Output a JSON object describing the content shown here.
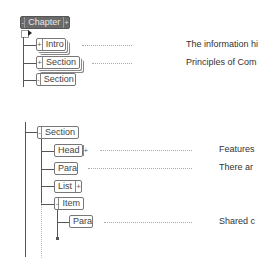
{
  "tree_top": {
    "root": {
      "label": "Chapter",
      "left_toggle": "-",
      "right_toggle": "+"
    },
    "children": [
      {
        "label": "Intro",
        "toggle": "+",
        "description": "The information hi"
      },
      {
        "label": "Section",
        "toggle": "+",
        "description": "Principles of Com"
      },
      {
        "label": "Section",
        "toggle": "-"
      }
    ]
  },
  "tree_bottom": {
    "root": {
      "label": "Section",
      "toggle": "-"
    },
    "children": [
      {
        "label": "Head",
        "right_toggle": "+",
        "description": "Features"
      },
      {
        "label": "Para",
        "description": "There ar"
      },
      {
        "label": "List",
        "right_toggle": "+"
      },
      {
        "label": "Item",
        "toggle": "-",
        "children": [
          {
            "label": "Para",
            "description": "Shared c"
          }
        ]
      }
    ]
  },
  "colors": {
    "root_fill": "#6a6a6a",
    "line": "#555555",
    "leader": "#aaaaaa"
  }
}
